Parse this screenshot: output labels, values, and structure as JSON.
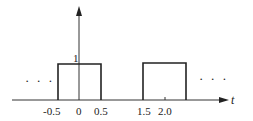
{
  "figure": {
    "type": "periodic-rectangular-pulse-train",
    "axis": {
      "x_label": "t"
    },
    "y_tick": "1",
    "x_ticks": [
      "-0.5",
      "0",
      "0.5",
      "1.5",
      "2.0"
    ],
    "ellipsis_left": "· · ·",
    "ellipsis_right": "· · ·",
    "pulses": [
      {
        "start": -0.5,
        "end": 0.5,
        "height": 1
      },
      {
        "start": 1.5,
        "end": 2.5,
        "height": 1
      }
    ]
  }
}
